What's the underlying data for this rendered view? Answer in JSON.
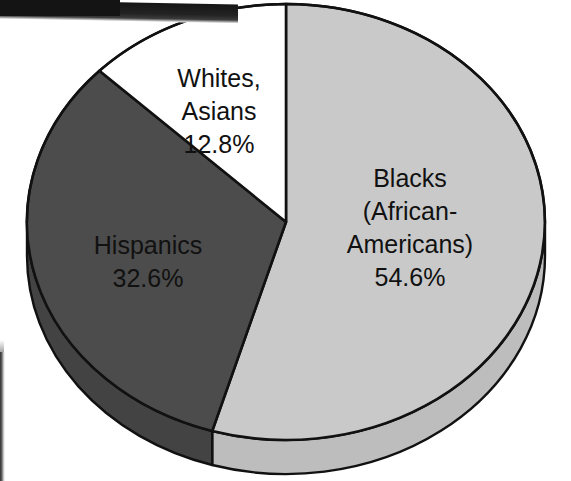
{
  "figure": {
    "kind": "scanned-pie-chart",
    "background_color": "#ffffff",
    "outline_color": "#111111"
  },
  "chart_data": {
    "type": "pie",
    "title": "",
    "subtitle": "",
    "xlabel": "",
    "ylabel": "",
    "legend_position": "none",
    "grid": false,
    "three_d": true,
    "start_angle_deg": 0,
    "direction": "clockwise",
    "categories": [
      "Blacks (African-Americans)",
      "Hispanics",
      "Whites, Asians"
    ],
    "values": [
      54.6,
      32.6,
      12.8
    ],
    "value_unit": "%",
    "colors": [
      "#c9c9c9",
      "#4c4c4c",
      "#ffffff"
    ],
    "slices": [
      {
        "name": "Blacks (African-Americans)",
        "label_lines": [
          "Blacks",
          "(African-",
          "Americans)",
          "54.6%"
        ],
        "value": 54.6,
        "value_text": "54.6%",
        "color": "#c9c9c9",
        "side_color": "#bdbdbd"
      },
      {
        "name": "Hispanics",
        "label_lines": [
          "Hispanics",
          "32.6%"
        ],
        "value": 32.6,
        "value_text": "32.6%",
        "color": "#4c4c4c",
        "side_color": "#434343"
      },
      {
        "name": "Whites, Asians",
        "label_lines": [
          "Whites,",
          "Asians",
          "12.8%"
        ],
        "value": 12.8,
        "value_text": "12.8%",
        "color": "#ffffff",
        "side_color": "#f0f0f0"
      }
    ]
  },
  "labels": {
    "blacks": {
      "line1": "Blacks",
      "line2": "(African-",
      "line3": "Americans)",
      "line4": "54.6%"
    },
    "hispanics": {
      "line1": "Hispanics",
      "line2": "32.6%"
    },
    "whites_asians": {
      "line1": "Whites,",
      "line2": "Asians",
      "line3": "12.8%"
    }
  }
}
